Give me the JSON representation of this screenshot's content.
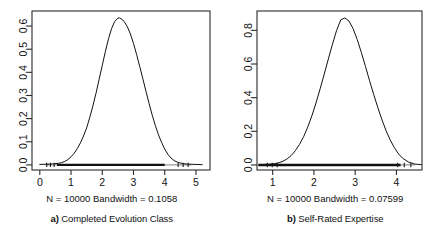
{
  "figure": {
    "panel_count": 2,
    "background": "#ffffff",
    "foreground": "#1a1a1a"
  },
  "panels": [
    {
      "id": "panel-a",
      "caption_lead": "a)",
      "caption_text": " Completed Evolution Class",
      "subtitle": "N = 10000    Bandwidth = 0.1058",
      "n_label": "N = 10000",
      "bandwidth_label": "Bandwidth = 0.1058"
    },
    {
      "id": "panel-b",
      "caption_lead": "b)",
      "caption_text": " Self-Rated Expertise",
      "subtitle": "N = 10000    Bandwidth = 0.07599",
      "n_label": "N = 10000",
      "bandwidth_label": "Bandwidth = 0.07599"
    }
  ],
  "chart_data": [
    {
      "type": "line",
      "subtype": "kernel-density",
      "title": "a) Completed Evolution Class",
      "subtitle": "N = 10000    Bandwidth = 0.1058",
      "xlabel": "",
      "ylabel": "",
      "n": 10000,
      "bandwidth": 0.1058,
      "grid": false,
      "legend": "none",
      "xlim": [
        -0.25,
        5.45
      ],
      "ylim": [
        -0.022,
        0.665
      ],
      "xticks": [
        0,
        1,
        2,
        3,
        4,
        5
      ],
      "xticklabels": [
        "0",
        "1",
        "2",
        "3",
        "4",
        "5"
      ],
      "yticks": [
        0.0,
        0.1,
        0.2,
        0.3,
        0.4,
        0.5,
        0.6
      ],
      "yticklabels": [
        "0.0",
        "0.1",
        "0.2",
        "0.3",
        "0.4",
        "0.5",
        "0.6"
      ],
      "peak_x": 2.55,
      "peak_y": 0.635,
      "line_color": "#111111",
      "line_width": 1.0,
      "rug_y": 0.0,
      "rug_span": [
        0.2,
        4.85
      ],
      "x": [
        0.0,
        0.2,
        0.4,
        0.6,
        0.7,
        0.8,
        0.9,
        1.0,
        1.1,
        1.2,
        1.3,
        1.4,
        1.5,
        1.6,
        1.7,
        1.8,
        1.9,
        2.0,
        2.1,
        2.2,
        2.3,
        2.4,
        2.5,
        2.55,
        2.6,
        2.7,
        2.8,
        2.9,
        3.0,
        3.1,
        3.2,
        3.3,
        3.4,
        3.5,
        3.6,
        3.7,
        3.8,
        3.9,
        4.0,
        4.1,
        4.2,
        4.3,
        4.4,
        4.6,
        4.8,
        5.0,
        5.2
      ],
      "y": [
        0.002,
        0.003,
        0.004,
        0.007,
        0.01,
        0.015,
        0.023,
        0.035,
        0.05,
        0.07,
        0.095,
        0.125,
        0.16,
        0.205,
        0.255,
        0.31,
        0.37,
        0.43,
        0.49,
        0.545,
        0.59,
        0.62,
        0.634,
        0.635,
        0.632,
        0.62,
        0.598,
        0.566,
        0.525,
        0.477,
        0.425,
        0.372,
        0.318,
        0.265,
        0.215,
        0.17,
        0.13,
        0.097,
        0.068,
        0.046,
        0.03,
        0.019,
        0.012,
        0.005,
        0.003,
        0.002,
        0.001
      ]
    },
    {
      "type": "line",
      "subtype": "kernel-density",
      "title": "b) Self-Rated Expertise",
      "subtitle": "N = 10000    Bandwidth = 0.07599",
      "xlabel": "",
      "ylabel": "",
      "n": 10000,
      "bandwidth": 0.07599,
      "grid": false,
      "legend": "none",
      "xlim": [
        0.62,
        4.62
      ],
      "ylim": [
        -0.03,
        0.915
      ],
      "xticks": [
        1,
        2,
        3,
        4
      ],
      "xticklabels": [
        "1",
        "2",
        "3",
        "4"
      ],
      "yticks": [
        0.0,
        0.2,
        0.4,
        0.6,
        0.8
      ],
      "yticklabels": [
        "0.0",
        "0.2",
        "0.4",
        "0.6",
        "0.8"
      ],
      "peak_x": 2.65,
      "peak_y": 0.875,
      "line_color": "#111111",
      "line_width": 1.0,
      "rug_y": 0.0,
      "rug_span": [
        0.85,
        4.45
      ],
      "x": [
        0.7,
        0.9,
        1.05,
        1.15,
        1.25,
        1.35,
        1.45,
        1.55,
        1.65,
        1.75,
        1.85,
        1.95,
        2.05,
        2.15,
        2.25,
        2.35,
        2.45,
        2.55,
        2.65,
        2.75,
        2.85,
        2.95,
        3.05,
        3.15,
        3.25,
        3.35,
        3.45,
        3.55,
        3.65,
        3.75,
        3.85,
        3.95,
        4.05,
        4.15,
        4.3,
        4.45,
        4.6
      ],
      "y": [
        0.002,
        0.004,
        0.008,
        0.013,
        0.022,
        0.036,
        0.056,
        0.085,
        0.122,
        0.168,
        0.225,
        0.292,
        0.368,
        0.452,
        0.54,
        0.63,
        0.718,
        0.8,
        0.862,
        0.874,
        0.855,
        0.81,
        0.745,
        0.668,
        0.585,
        0.5,
        0.418,
        0.34,
        0.268,
        0.203,
        0.148,
        0.103,
        0.066,
        0.04,
        0.016,
        0.005,
        0.002
      ]
    }
  ]
}
